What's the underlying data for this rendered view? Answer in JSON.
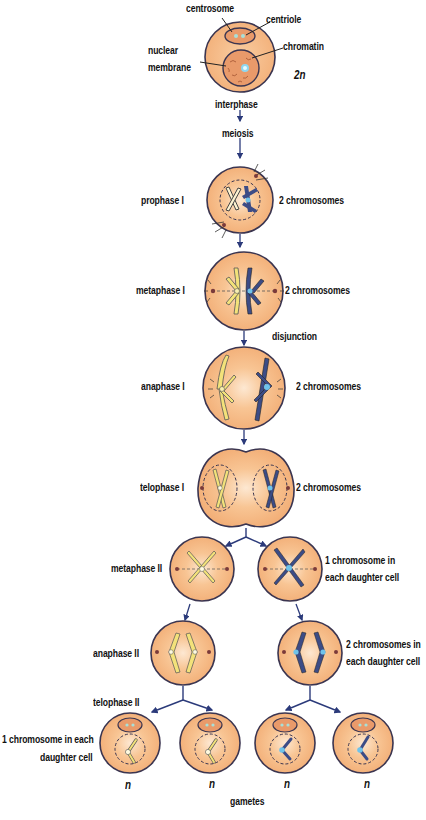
{
  "diagram": {
    "type": "meiosis-stages",
    "colors": {
      "cell_fill": "#f6b883",
      "cell_highlight": "#fde6cc",
      "cell_outline": "#3b3550",
      "nucleus_fill": "#e99a6a",
      "arrow": "#2b3a7a",
      "chromosome_yellow": "#f3e27a",
      "chromosome_blue": "#3c4c86",
      "centromere_blue": "#6fc3ea",
      "text": "#111111"
    },
    "interphase_cell": {
      "labels": {
        "centrosome": "centrosome",
        "centriole": "centriole",
        "chromatin": "chromatin",
        "nuclear_membrane_line1": "nuclear",
        "nuclear_membrane_line2": "membrane",
        "ploidy": "2n"
      }
    },
    "flow_labels": {
      "interphase": "interphase",
      "meiosis": "meiosis",
      "disjunction": "disjunction",
      "gametes": "gametes"
    },
    "stages": [
      {
        "name": "prophase I",
        "note": "2 chromosomes"
      },
      {
        "name": "metaphase I",
        "note": "2 chromosomes"
      },
      {
        "name": "anaphase I",
        "note": "2 chromosomes"
      },
      {
        "name": "telophase I",
        "note": "2 chromosomes"
      },
      {
        "name": "metaphase II",
        "note_line1": "1 chromosome in",
        "note_line2": "each daughter cell"
      },
      {
        "name": "anaphase II",
        "note_line1": "2 chromosomes in",
        "note_line2": "each daughter cell"
      },
      {
        "name": "telophase II",
        "note_line1": "1 chromosome in each",
        "note_line2": "daughter cell"
      }
    ],
    "gamete_ploidy": [
      "n",
      "n",
      "n",
      "n"
    ]
  }
}
